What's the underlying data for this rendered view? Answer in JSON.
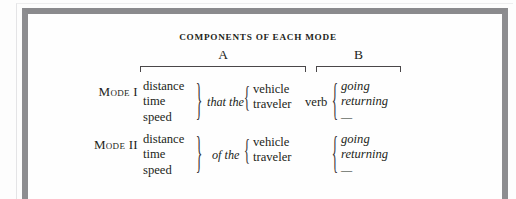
{
  "figure": {
    "title": "COMPONENTS OF EACH MODE",
    "frame_color": "#8d8d90",
    "text_color": "#231f20",
    "background": "#fdfdfd"
  },
  "column_groups": [
    {
      "letter": "A",
      "label_name": "group-letter-a"
    },
    {
      "letter": "B",
      "label_name": "group-letter-b"
    }
  ],
  "braces": {
    "right": "}",
    "left": "{"
  },
  "rows": [
    {
      "mode_label": "Mode I",
      "measures": [
        "distance",
        "time",
        "speed"
      ],
      "connective": "that the",
      "subject": [
        "vehicle",
        "traveler"
      ],
      "head_word": "verb",
      "aspect": [
        "going",
        "returning",
        "—"
      ]
    },
    {
      "mode_label": "Mode II",
      "measures": [
        "distance",
        "time",
        "speed"
      ],
      "connective": "of the",
      "subject": [
        "vehicle",
        "traveler"
      ],
      "head_word": "",
      "aspect": [
        "going",
        "returning",
        "—"
      ]
    }
  ]
}
